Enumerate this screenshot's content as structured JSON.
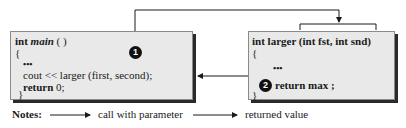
{
  "main_function": {
    "signature_type": "int",
    "signature_name": "main",
    "signature_parens": " ( )",
    "open_brace": "{",
    "ellipsis": "•••",
    "call_line": "cout << larger (first, second);",
    "return_keyword": "return",
    "return_value": " 0;",
    "close_brace": "}"
  },
  "larger_function": {
    "signature": "int larger (int fst, int snd)",
    "open_brace": "{",
    "ellipsis": "•••",
    "return_keyword": "return",
    "return_value": " max ;",
    "close_brace": "}"
  },
  "markers": {
    "step1": "1",
    "step2": "2"
  },
  "notes": {
    "label": "Notes:",
    "call_legend": "call with parameter",
    "return_legend": "returned value"
  },
  "colors": {
    "box_fill": "#e9e9e9",
    "line": "#1a1a1a",
    "marker_fill": "#111111"
  }
}
